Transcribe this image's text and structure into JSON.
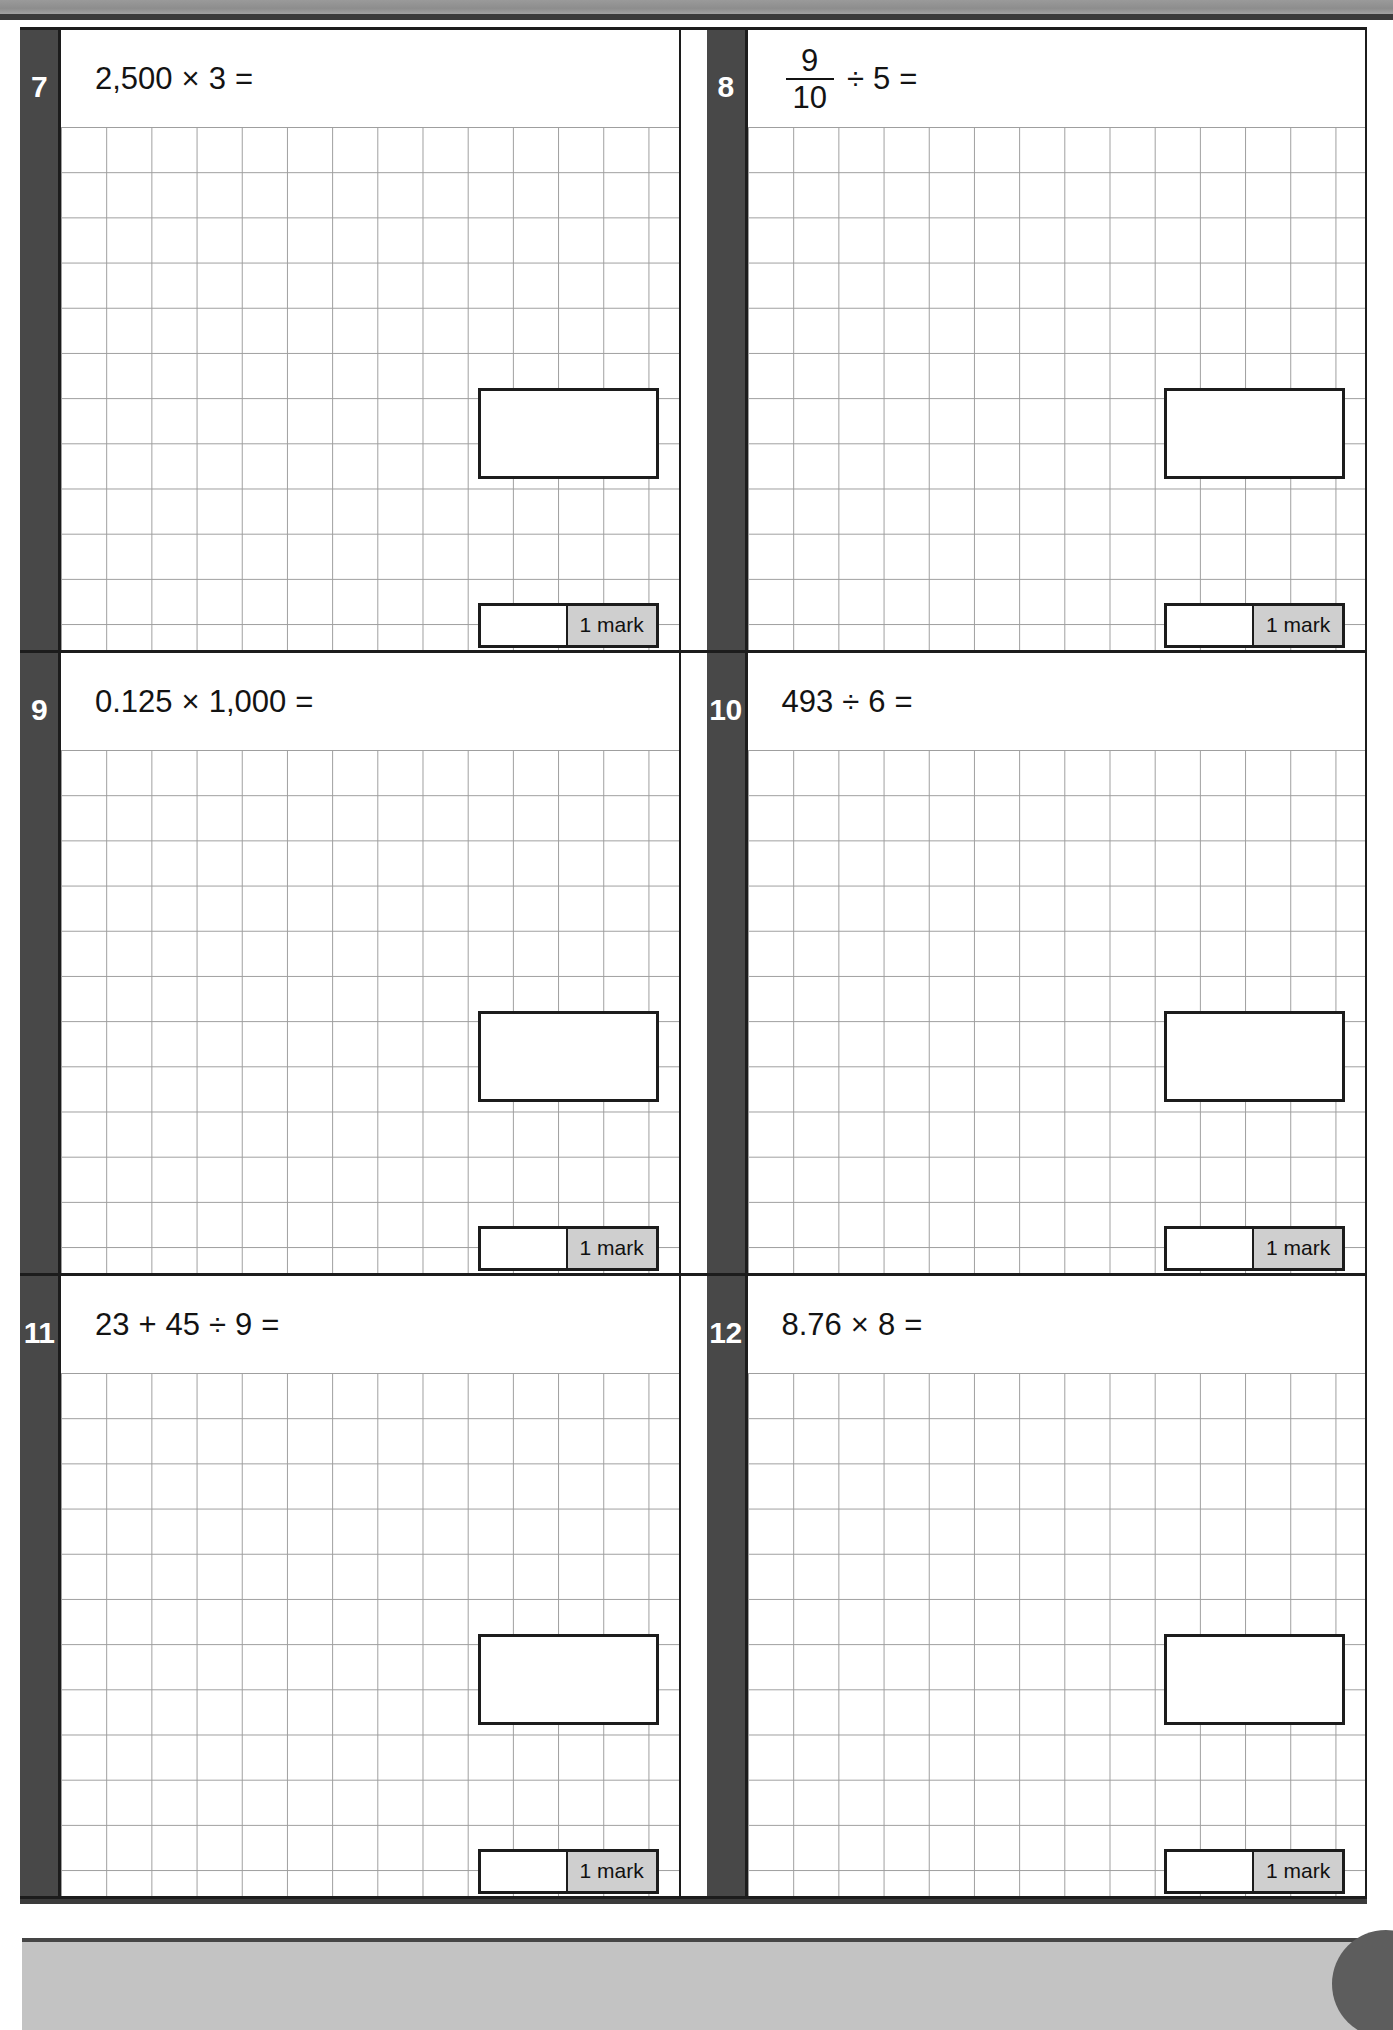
{
  "page": {
    "kind": "arithmetic-test-page",
    "mark_label": "1 mark",
    "colors": {
      "number_tab": "#484848",
      "border": "#1c1c1c",
      "grid_line": "#9e9e9e",
      "mark_badge": "#cfcfcf",
      "footer_bar": "#c3c3c3",
      "top_banner": "#8d8d8d"
    }
  },
  "questions": [
    {
      "number": "7",
      "expression": "2,500 × 3 =",
      "parts": [
        {
          "type": "text",
          "value": "2,500"
        },
        {
          "type": "op",
          "value": "×"
        },
        {
          "type": "text",
          "value": "3"
        },
        {
          "type": "op",
          "value": "="
        }
      ],
      "mark": "1 mark"
    },
    {
      "number": "8",
      "expression": "9/10 ÷ 5 =",
      "parts": [
        {
          "type": "fraction",
          "numerator": "9",
          "denominator": "10"
        },
        {
          "type": "op",
          "value": "÷"
        },
        {
          "type": "text",
          "value": "5"
        },
        {
          "type": "op",
          "value": "="
        }
      ],
      "mark": "1 mark"
    },
    {
      "number": "9",
      "expression": "0.125 × 1,000 =",
      "parts": [
        {
          "type": "text",
          "value": "0.125"
        },
        {
          "type": "op",
          "value": "×"
        },
        {
          "type": "text",
          "value": "1,000"
        },
        {
          "type": "op",
          "value": "="
        }
      ],
      "mark": "1 mark"
    },
    {
      "number": "10",
      "expression": "493 ÷ 6 =",
      "parts": [
        {
          "type": "text",
          "value": "493"
        },
        {
          "type": "op",
          "value": "÷"
        },
        {
          "type": "text",
          "value": "6"
        },
        {
          "type": "op",
          "value": "="
        }
      ],
      "mark": "1 mark"
    },
    {
      "number": "11",
      "expression": "23 + 45 ÷ 9 =",
      "parts": [
        {
          "type": "text",
          "value": "23"
        },
        {
          "type": "op",
          "value": "+"
        },
        {
          "type": "text",
          "value": "45"
        },
        {
          "type": "op",
          "value": "÷"
        },
        {
          "type": "text",
          "value": "9"
        },
        {
          "type": "op",
          "value": "="
        }
      ],
      "mark": "1 mark"
    },
    {
      "number": "12",
      "expression": "8.76 × 8 =",
      "parts": [
        {
          "type": "text",
          "value": "8.76"
        },
        {
          "type": "op",
          "value": "×"
        },
        {
          "type": "text",
          "value": "8"
        },
        {
          "type": "op",
          "value": "="
        }
      ],
      "mark": "1 mark"
    }
  ]
}
